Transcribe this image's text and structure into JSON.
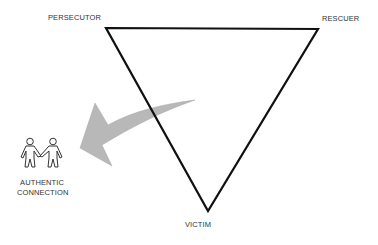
{
  "diagram": {
    "type": "drama-triangle",
    "nodes": {
      "top_left": "PERSECUTOR",
      "top_right": "RESCUER",
      "bottom": "VICTIM"
    },
    "exit": {
      "label_line1": "AUTHENTIC",
      "label_line2": "CONNECTION",
      "icon": "two-people-holding-hands-icon"
    },
    "arrow": {
      "direction": "from triangle toward authentic connection",
      "color": "#b8b8b8"
    },
    "colors": {
      "triangle_stroke": "#111111",
      "label_text": "#333333",
      "background": "#ffffff"
    }
  }
}
